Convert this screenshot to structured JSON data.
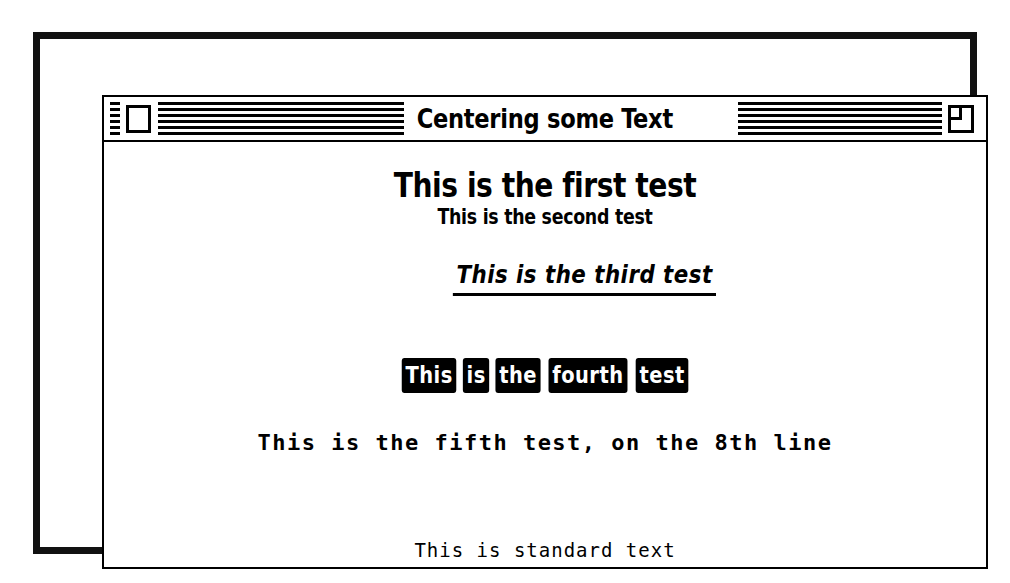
{
  "window": {
    "title": "Centering some Text",
    "close_box": "close-box",
    "zoom_box": "zoom-box"
  },
  "document": {
    "lines": [
      {
        "id": "first",
        "text": "This is the first test",
        "style": "bold-large"
      },
      {
        "id": "second",
        "text": "This is the second test",
        "style": "bold-small"
      },
      {
        "id": "third",
        "text": "This is the third test",
        "style": "bold-italic-underline"
      },
      {
        "id": "fourth",
        "text": "This is the fourth test",
        "style": "outline-inverse",
        "words": [
          "This",
          "is",
          "the",
          "fourth",
          "test"
        ]
      },
      {
        "id": "fifth",
        "text": "This is the fifth test, on the 8th line",
        "style": "bold-monospace"
      },
      {
        "id": "standard",
        "text": "This is standard text",
        "style": "plain-monospace"
      }
    ]
  },
  "colors": {
    "ink": "#000000",
    "paper": "#ffffff"
  }
}
